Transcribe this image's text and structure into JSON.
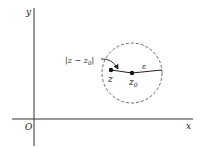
{
  "diagram": {
    "axes": {
      "x_label": "x",
      "y_label": "y",
      "origin_label": "O",
      "color": "#333333"
    },
    "circle": {
      "style": "dashed",
      "color": "#555555"
    },
    "points": [
      {
        "id": "z",
        "label": "z"
      },
      {
        "id": "z0",
        "label": "z",
        "subscript": "0"
      }
    ],
    "radius_label": "ε",
    "distance_label": {
      "prefix": "|z − z",
      "subscript": "0",
      "suffix": "|"
    },
    "ink_color": "#222222"
  }
}
